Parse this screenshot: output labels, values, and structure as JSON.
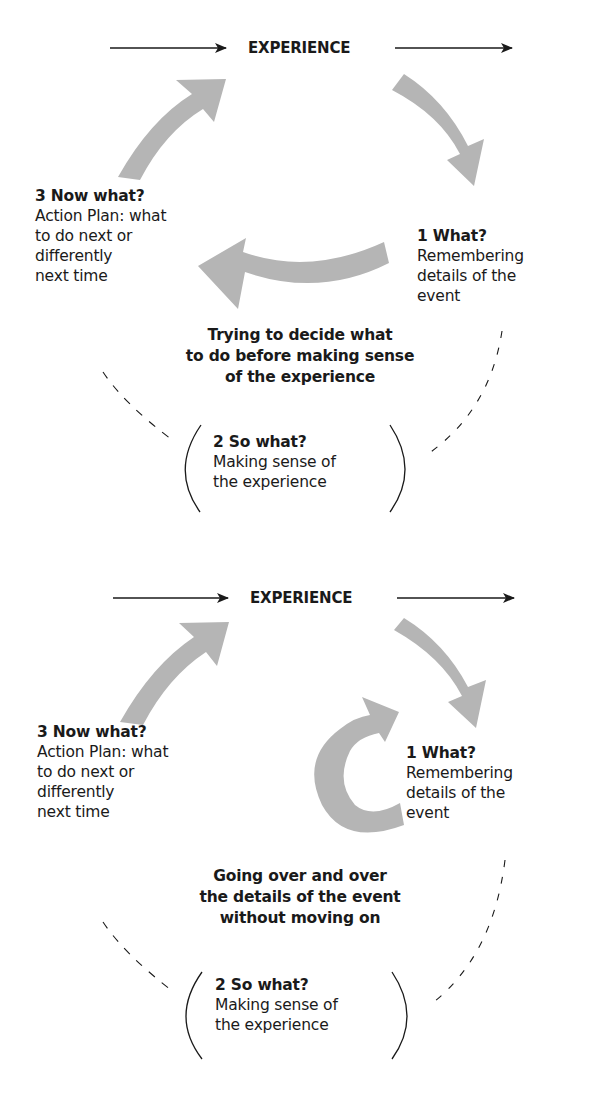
{
  "colors": {
    "arrow_fill": "#b5b5b5",
    "line": "#1a1a1a",
    "text": "#1a1a1a"
  },
  "panels": [
    {
      "experience_label": "EXPERIENCE",
      "stage1": {
        "title": "1 What?",
        "lines": [
          "Remembering",
          "details of the",
          "event"
        ]
      },
      "stage2": {
        "title": "2 So what?",
        "lines": [
          "Making sense of",
          "the experience"
        ]
      },
      "stage3": {
        "title": "3 Now what?",
        "lines": [
          "Action Plan: what",
          "to do next or",
          "differently",
          "next time"
        ]
      },
      "caption": {
        "lines": [
          "Trying to decide what",
          "to do before making sense",
          "of the experience"
        ]
      },
      "shortcut_arrow": "curved-left-arrow"
    },
    {
      "experience_label": "EXPERIENCE",
      "stage1": {
        "title": "1 What?",
        "lines": [
          "Remembering",
          "details of the",
          "event"
        ]
      },
      "stage2": {
        "title": "2 So what?",
        "lines": [
          "Making sense of",
          "the experience"
        ]
      },
      "stage3": {
        "title": "3 Now what?",
        "lines": [
          "Action Plan: what",
          "to do next or",
          "differently",
          "next time"
        ]
      },
      "caption": {
        "lines": [
          "Going over and over",
          "the details of the event",
          "without moving on"
        ]
      },
      "shortcut_arrow": "loop-back-arrow"
    }
  ]
}
